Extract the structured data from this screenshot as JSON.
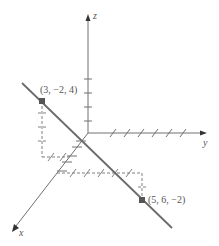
{
  "diagram": {
    "axes": {
      "x": {
        "label": "x"
      },
      "y": {
        "label": "y"
      },
      "z": {
        "label": "z"
      }
    },
    "points": [
      {
        "name": "A",
        "label": "(3, −2, 4)",
        "coords": [
          3,
          -2,
          4
        ]
      },
      {
        "name": "B",
        "label": "(5, 6, −2)",
        "coords": [
          5,
          6,
          -2
        ]
      }
    ],
    "line": {
      "through": [
        "A",
        "B"
      ],
      "color": "#6b6b6b"
    },
    "colors": {
      "axis": "#707070",
      "line": "#6b6b6b",
      "point": "#555555",
      "dashed": "#808080"
    }
  }
}
